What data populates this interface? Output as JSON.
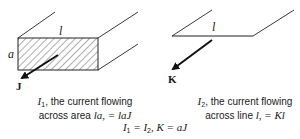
{
  "left_figure": {
    "width_label": "l",
    "height_label": "a",
    "vector_label": "J",
    "caption_line1_symbol": "I",
    "caption_line1_sub": "1",
    "caption_line1_text": ", the current flowing",
    "caption_line2_text": "across area ",
    "caption_line2_math": "la, = laJ"
  },
  "right_figure": {
    "length_label": "l",
    "vector_label": "K",
    "caption_line1_symbol": "I",
    "caption_line1_sub": "2",
    "caption_line1_text": ", the current flowing",
    "caption_line2_text": "across line ",
    "caption_line2_math": "l, = Kl"
  },
  "equation": {
    "lhs_symbol": "I",
    "lhs_sub": "1",
    "eq1": " = ",
    "rhs_symbol": "I",
    "rhs_sub": "2",
    "rest": ", K = aJ"
  },
  "colors": {
    "ink": "#1a1a1a",
    "background": "#ffffff"
  }
}
